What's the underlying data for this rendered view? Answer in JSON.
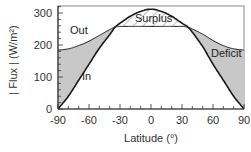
{
  "chart_data": {
    "type": "area",
    "title": "",
    "xlabel": "Latitude (°)",
    "ylabel": "| Flux | (W/m²)",
    "xlim": [
      -90,
      90
    ],
    "ylim": [
      0,
      322
    ],
    "x_ticks": [
      -90,
      -60,
      -30,
      0,
      30,
      60,
      90
    ],
    "y_ticks": [
      0,
      100,
      200,
      300
    ],
    "grid": false,
    "legend": "none",
    "x": [
      -90,
      -80,
      -70,
      -60,
      -50,
      -40,
      -35,
      -30,
      -20,
      -10,
      0,
      10,
      20,
      30,
      35,
      40,
      50,
      60,
      70,
      80,
      90
    ],
    "series": [
      {
        "name": "In",
        "values": [
          0,
          40,
          90,
          140,
          190,
          232,
          255,
          268,
          290,
          305,
          312,
          305,
          290,
          268,
          258,
          240,
          195,
          140,
          90,
          40,
          0
        ]
      },
      {
        "name": "Out",
        "values": [
          184,
          188,
          198,
          212,
          230,
          248,
          256,
          258,
          258,
          258,
          258,
          258,
          258,
          258,
          256,
          250,
          234,
          214,
          198,
          188,
          184
        ]
      }
    ],
    "annotations": [
      {
        "text": "Out",
        "x": -72,
        "y": 240
      },
      {
        "text": "In",
        "x": -60,
        "y": 93
      },
      {
        "text": "Surplus",
        "x": 5,
        "y": 285,
        "region": "In > Out (hatched)"
      },
      {
        "text": "Deficit",
        "x": 72,
        "y": 170,
        "region": "Out > In (gray shaded)"
      }
    ]
  },
  "labels": {
    "xlabel": "Latitude (°)",
    "ylabel": "| Flux | (W/m²)",
    "out": "Out",
    "in": "In",
    "surplus": "Surplus",
    "deficit": "Deficit",
    "y_ticks": [
      "0",
      "100",
      "200",
      "300"
    ],
    "x_ticks": [
      "-90",
      "-60",
      "-30",
      "0",
      "30",
      "60",
      "90"
    ]
  },
  "colors": {
    "deficit_fill": "#c8c8c8",
    "line": "#1a1a1a",
    "frame": "#666666"
  }
}
